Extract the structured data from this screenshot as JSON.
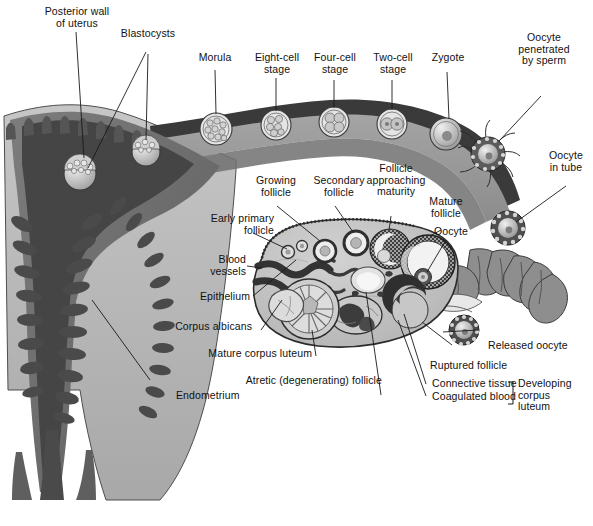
{
  "figure": {
    "type": "anatomical-diagram",
    "palette": {
      "background": "#ffffff",
      "uterine_cavity": "#4a4a4a",
      "endometrium": "#6e6e6e",
      "myometrium": "#b8b8b8",
      "tube_wall_dark": "#3a3a3a",
      "tube_lumen": "#9a9a9a",
      "ovary_stroma": "#c2c2c2",
      "ovary_outline": "#2b2b2b",
      "follicle_fill": "#e8e8e8",
      "granulosa_dark": "#3d3d3d",
      "blood_vessel": "#3a3a3a",
      "leader_line": "#1a1a1a",
      "label_text": "#111111"
    }
  },
  "labels": {
    "posterior_wall": "Posterior wall\nof uterus",
    "blastocysts": "Blastocysts",
    "morula": "Morula",
    "eight_cell": "Eight-cell\nstage",
    "four_cell": "Four-cell\nstage",
    "two_cell": "Two-cell\nstage",
    "zygote": "Zygote",
    "oocyte_penetrated": "Oocyte\npenetrated\nby sperm",
    "oocyte_in_tube": "Oocyte\nin tube",
    "growing_follicle": "Growing\nfollicle",
    "secondary_follicle": "Secondary\nfollicle",
    "follicle_approaching": "Follicle\napproaching\nmaturity",
    "mature_follicle": "Mature\nfollicle",
    "oocyte": "Oocyte",
    "early_primary_follicle": "Early primary\nfollicle",
    "blood_vessels": "Blood\nvessels",
    "epithelium": "Epithelium",
    "corpus_albicans": "Corpus albicans",
    "mature_corpus_luteum": "Mature corpus luteum",
    "atretic_follicle": "Atretic (degenerating) follicle",
    "endometrium": "Endometrium",
    "released_oocyte": "Released oocyte",
    "ruptured_follicle": "Ruptured follicle",
    "connective_tissue": "Connective tissue",
    "coagulated_blood": "Coagulated blood",
    "developing_corpus_luteum": "Developing\ncorpus\nluteum"
  },
  "stages_in_tube": [
    {
      "name": "morula",
      "label": "Morula",
      "cells": "many"
    },
    {
      "name": "eight-cell-stage",
      "label": "Eight-cell stage",
      "cells": 8
    },
    {
      "name": "four-cell-stage",
      "label": "Four-cell stage",
      "cells": 4
    },
    {
      "name": "two-cell-stage",
      "label": "Two-cell stage",
      "cells": 2
    },
    {
      "name": "zygote",
      "label": "Zygote",
      "cells": 1
    }
  ],
  "ovarian_structures": [
    "early primary follicle",
    "growing follicle",
    "secondary follicle",
    "follicle approaching maturity",
    "mature follicle",
    "ruptured follicle",
    "developing corpus luteum",
    "mature corpus luteum",
    "corpus albicans",
    "atretic (degenerating) follicle"
  ]
}
